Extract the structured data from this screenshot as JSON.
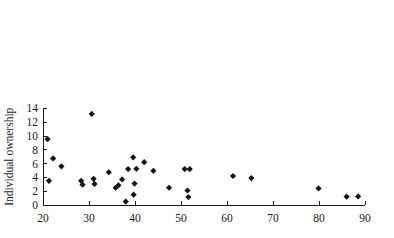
{
  "chart_data": {
    "type": "scatter",
    "title": "",
    "xlabel": "",
    "ylabel": "Individual ownership",
    "xlim": [
      18,
      91
    ],
    "ylim": [
      0,
      14
    ],
    "xticks": [
      20,
      30,
      40,
      50,
      60,
      70,
      80,
      90
    ],
    "yticks": [
      0,
      2,
      4,
      6,
      8,
      10,
      12,
      14
    ],
    "xticklabels": [
      "20",
      "30",
      "40",
      "50",
      "60",
      "70",
      "80",
      "90"
    ],
    "yticklabels": [
      "0",
      "2",
      "4",
      "6",
      "8",
      "10",
      "12",
      "14"
    ],
    "grid": false,
    "legend": null,
    "marker": "diamond",
    "marker_color": "#141414",
    "points": [
      {
        "x": 21.0,
        "y": 9.55
      },
      {
        "x": 21.3,
        "y": 3.5
      },
      {
        "x": 22.2,
        "y": 6.75
      },
      {
        "x": 24.0,
        "y": 5.6
      },
      {
        "x": 28.3,
        "y": 3.5
      },
      {
        "x": 28.6,
        "y": 2.95
      },
      {
        "x": 30.6,
        "y": 13.2
      },
      {
        "x": 31.0,
        "y": 3.8
      },
      {
        "x": 31.2,
        "y": 3.05
      },
      {
        "x": 34.3,
        "y": 4.75
      },
      {
        "x": 35.8,
        "y": 2.5
      },
      {
        "x": 36.4,
        "y": 2.85
      },
      {
        "x": 37.2,
        "y": 3.7
      },
      {
        "x": 38.0,
        "y": 0.5
      },
      {
        "x": 38.5,
        "y": 5.2
      },
      {
        "x": 39.6,
        "y": 6.9
      },
      {
        "x": 39.7,
        "y": 1.5
      },
      {
        "x": 39.9,
        "y": 3.1
      },
      {
        "x": 40.3,
        "y": 5.25
      },
      {
        "x": 42.0,
        "y": 6.2
      },
      {
        "x": 44.0,
        "y": 4.95
      },
      {
        "x": 47.4,
        "y": 2.5
      },
      {
        "x": 50.8,
        "y": 5.2
      },
      {
        "x": 51.4,
        "y": 2.1
      },
      {
        "x": 51.6,
        "y": 1.15
      },
      {
        "x": 51.9,
        "y": 5.2
      },
      {
        "x": 61.3,
        "y": 4.2
      },
      {
        "x": 65.3,
        "y": 3.9
      },
      {
        "x": 79.9,
        "y": 2.4
      },
      {
        "x": 86.0,
        "y": 1.2
      },
      {
        "x": 88.5,
        "y": 1.25
      }
    ]
  }
}
